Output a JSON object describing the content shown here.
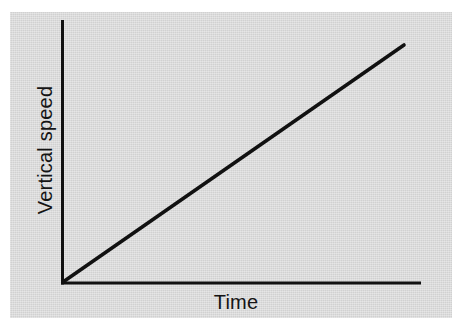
{
  "chart_data": {
    "type": "line",
    "title": "",
    "subtitle": "",
    "xlabel": "Time",
    "ylabel": "Vertical speed",
    "xtick_labels": [],
    "ytick_labels": [],
    "grid": false,
    "legend": null,
    "legend_position": "none",
    "annotations": [],
    "xlim": [
      0,
      1
    ],
    "ylim": [
      0,
      1
    ],
    "series": [
      {
        "name": "Vertical speed vs time",
        "style": "solid",
        "color": "#111111",
        "x": [
          0,
          0.25,
          0.5,
          0.75,
          1
        ],
        "y": [
          0,
          0.25,
          0.5,
          0.75,
          1
        ]
      }
    ]
  },
  "figure": {
    "panel_color": "#d6d6d6",
    "page_color": "#ffffff",
    "axis_color": "#111111",
    "line_color": "#111111"
  },
  "axes": {
    "x_label": "Time",
    "y_label": "Vertical speed"
  }
}
